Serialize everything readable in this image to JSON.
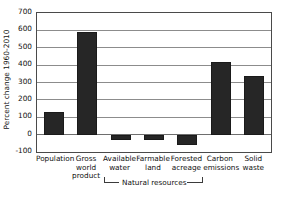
{
  "chart_data": {
    "type": "bar",
    "title": "",
    "subtitle": "",
    "xlabel": "",
    "ylabel": "Percent change 1960-2010",
    "categories": [
      "Population",
      "Gross world product",
      "Available water",
      "Farmable land",
      "Forested acreage",
      "Carbon emissions",
      "Solid waste"
    ],
    "category_lines": [
      [
        "Population"
      ],
      [
        "Gross",
        "world",
        "product"
      ],
      [
        "Available",
        "water"
      ],
      [
        "Farmable",
        "land"
      ],
      [
        "Forested",
        "acreage"
      ],
      [
        "Carbon",
        "emissions"
      ],
      [
        "Solid",
        "waste"
      ]
    ],
    "values": [
      130,
      590,
      -30,
      -30,
      -60,
      420,
      335
    ],
    "ylim": [
      -100,
      700
    ],
    "yticks": [
      700,
      600,
      500,
      400,
      300,
      200,
      100,
      0,
      -100
    ],
    "ytick_labels": [
      "700",
      "600",
      "500",
      "400",
      "300",
      "200",
      "100",
      "0",
      "-100"
    ],
    "grid": true,
    "legend": null,
    "legend_position": "none",
    "bar_color": "#262626",
    "grid_color": "#8c8c8c",
    "axis_color": "#4a4a4a",
    "background_color": "#ffffff",
    "annotations": [
      {
        "text": "Natural resources",
        "type": "group-bracket",
        "covers": [
          "Available water",
          "Farmable land",
          "Forested acreage"
        ]
      }
    ]
  }
}
